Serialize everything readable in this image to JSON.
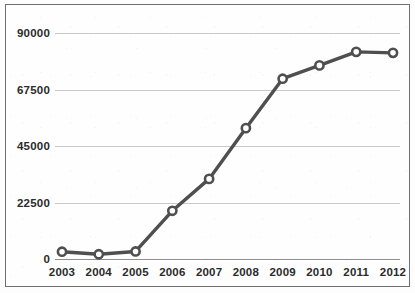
{
  "chart_data": {
    "type": "line",
    "title": "",
    "subtitle": "",
    "xlabel": "",
    "ylabel": "",
    "categories": [
      "2003",
      "2004",
      "2005",
      "2006",
      "2007",
      "2008",
      "2009",
      "2010",
      "2011",
      "2012"
    ],
    "x": [
      2003,
      2004,
      2005,
      2006,
      2007,
      2008,
      2009,
      2010,
      2011,
      2012
    ],
    "values": [
      2900,
      1900,
      3000,
      19200,
      31900,
      52100,
      71800,
      77100,
      82500,
      82100
    ],
    "series": [
      {
        "name": "",
        "values": [
          2900,
          1900,
          3000,
          19200,
          31900,
          52100,
          71800,
          77100,
          82500,
          82100
        ]
      }
    ],
    "ylim": [
      0,
      90000
    ],
    "ytick_labels": [
      "0",
      "22500",
      "45000",
      "67500",
      "90000"
    ],
    "ytick_values": [
      0,
      22500,
      45000,
      67500,
      90000
    ],
    "xtick_labels": [
      "2003",
      "2004",
      "2005",
      "2006",
      "2007",
      "2008",
      "2009",
      "2010",
      "2011",
      "2012"
    ],
    "grid": true,
    "grid_axis": "y",
    "legend": false,
    "legend_position": "none",
    "annotations": [],
    "marker": "circle-open",
    "colors": {
      "line": "#4f4f4f",
      "marker_fill": "#ffffff",
      "marker_stroke": "#4f4f4f",
      "gridline": "#c9c9c9",
      "axis": "#8f8f8f",
      "border": "#6f6f6f",
      "text": "#2b2b2b",
      "background": "#fefefe"
    }
  }
}
